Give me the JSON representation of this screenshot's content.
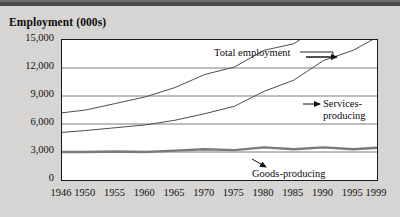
{
  "figure": {
    "title": "Employment (000s)",
    "background_color": "#d6d5d3",
    "plot_background": "#ffffff",
    "top_rule_color": "#4a4a4a"
  },
  "annotations": {
    "total": "Total employment",
    "services_line1": "Services-",
    "services_line2": "producing",
    "goods": "Goods-producing"
  },
  "chart_data": {
    "type": "line",
    "title": "Employment (000s)",
    "xlabel": "",
    "ylabel": "Employment (000s)",
    "ylim": [
      0,
      15000
    ],
    "yticks": [
      0,
      3000,
      6000,
      9000,
      12000,
      15000
    ],
    "ytick_labels": [
      "0",
      "3,000",
      "6,000",
      "9,000",
      "12,000",
      "15,000"
    ],
    "x": [
      1946,
      1950,
      1955,
      1960,
      1965,
      1970,
      1975,
      1980,
      1985,
      1990,
      1995,
      1999
    ],
    "xtick_labels": [
      "1946",
      "1950",
      "1955",
      "1960",
      "1965",
      "1970",
      "1975",
      "1980",
      "1985",
      "1990",
      "1995",
      "1999"
    ],
    "xlim": [
      1946,
      1999
    ],
    "grid": true,
    "grid_axis": "y",
    "legend": "annotated-inline",
    "series": [
      {
        "name": "Total employment",
        "color": "#4d4d4d",
        "width": 1,
        "values": [
          7200,
          7500,
          8200,
          8900,
          9900,
          11300,
          12100,
          13900,
          14600,
          16700,
          17400,
          18600
        ]
      },
      {
        "name": "Services-producing",
        "color": "#4d4d4d",
        "width": 1,
        "values": [
          5100,
          5300,
          5600,
          5900,
          6400,
          7100,
          7900,
          9500,
          10700,
          12800,
          13900,
          15300
        ]
      },
      {
        "name": "Goods-producing",
        "color": "#7a7a7a",
        "width": 2.4,
        "values": [
          3000,
          3000,
          3050,
          3000,
          3150,
          3300,
          3200,
          3500,
          3300,
          3500,
          3300,
          3450
        ]
      }
    ]
  }
}
